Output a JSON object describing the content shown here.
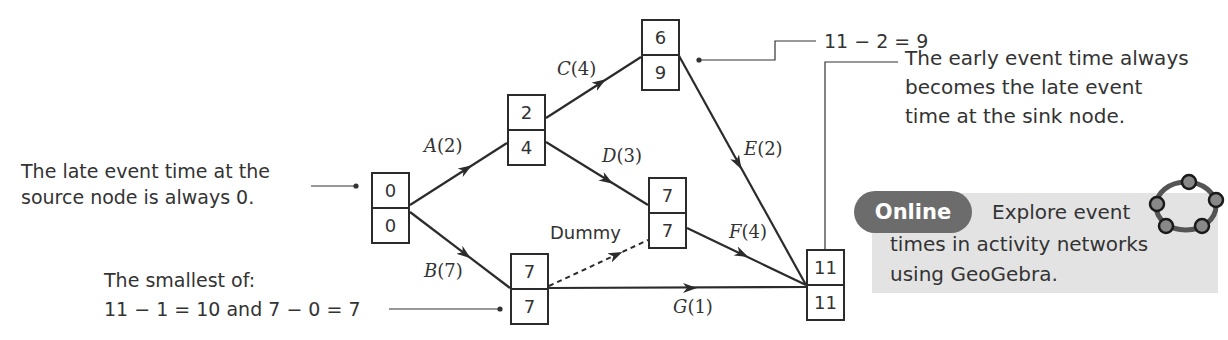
{
  "diagram": {
    "type": "activity-network",
    "title_partial": "",
    "nodes": [
      {
        "id": "source",
        "early": "0",
        "late": "0"
      },
      {
        "id": "n2",
        "early": "2",
        "late": "4"
      },
      {
        "id": "n3",
        "early": "6",
        "late": "9"
      },
      {
        "id": "n4",
        "early": "7",
        "late": "7"
      },
      {
        "id": "n5",
        "early": "7",
        "late": "7"
      },
      {
        "id": "sink",
        "early": "11",
        "late": "11"
      }
    ],
    "activities": [
      {
        "name": "A",
        "duration": "(2)",
        "from": "source",
        "to": "n2"
      },
      {
        "name": "B",
        "duration": "(7)",
        "from": "source",
        "to": "n5"
      },
      {
        "name": "C",
        "duration": "(4)",
        "from": "n2",
        "to": "n3"
      },
      {
        "name": "D",
        "duration": "(3)",
        "from": "n2",
        "to": "n4"
      },
      {
        "name": "E",
        "duration": "(2)",
        "from": "n3",
        "to": "sink"
      },
      {
        "name": "F",
        "duration": "(4)",
        "from": "n4",
        "to": "sink"
      },
      {
        "name": "G",
        "duration": "(1)",
        "from": "n5",
        "to": "sink"
      }
    ],
    "dummy": {
      "label": "Dummy",
      "from": "n5",
      "to": "n4"
    },
    "annotations": {
      "source_line1": "The late event time at the",
      "source_line2": "source node is always 0.",
      "n3_calc": "11 − 2 = 9",
      "sink_line1": "The early event time always",
      "sink_line2": "becomes the late event",
      "sink_line3": "time at the sink node.",
      "n5_line1": "The smallest of:",
      "n5_line2": "11 − 1 = 10 and 7 − 0 = 7"
    }
  },
  "online": {
    "badge": "Online",
    "line1": "Explore event",
    "line2": "times in activity networks",
    "line3": "using GeoGebra.",
    "icon": "geogebra-icon",
    "badge_color": "#6c6c6c",
    "box_color": "#e3e3e3"
  }
}
